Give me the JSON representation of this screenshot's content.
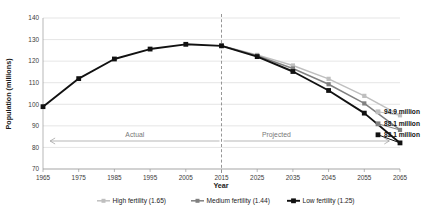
{
  "chart_data": {
    "type": "line",
    "title": "",
    "xlabel": "Year",
    "ylabel": "Population (millions)",
    "xlim": [
      1965,
      2065
    ],
    "ylim": [
      70,
      140
    ],
    "ytick_step": 10,
    "xtick_step": 10,
    "grid": true,
    "legend_position": "bottom",
    "categories": [
      1965,
      1975,
      1985,
      1995,
      2005,
      2015,
      2025,
      2035,
      2045,
      2055,
      2065
    ],
    "xticks": [
      "1965",
      "1975",
      "1985",
      "1995",
      "2005",
      "2015",
      "2025",
      "2035",
      "2045",
      "2055",
      "2065"
    ],
    "yticks": [
      "70",
      "80",
      "90",
      "100",
      "110",
      "120",
      "130",
      "140"
    ],
    "series": [
      {
        "name": "High fertility (1.65)",
        "color": "#bfbfbf",
        "marker": "square",
        "x": [
          2015,
          2025,
          2035,
          2045,
          2055,
          2065
        ],
        "values": [
          127.1,
          122.9,
          118.0,
          111.8,
          103.9,
          94.9
        ],
        "end_label": "94.9 million"
      },
      {
        "name": "Medium fertility (1.44)",
        "color": "#808080",
        "marker": "square",
        "x": [
          2015,
          2025,
          2035,
          2045,
          2055,
          2065
        ],
        "values": [
          127.1,
          122.5,
          116.6,
          109.3,
          100.4,
          88.1
        ],
        "end_label": "88.1 million"
      },
      {
        "name": "Low fertility (1.25)",
        "color": "#111111",
        "marker": "square",
        "x": [
          1965,
          1975,
          1985,
          1995,
          2005,
          2015,
          2025,
          2035,
          2045,
          2055,
          2065
        ],
        "values": [
          98.9,
          111.9,
          121.0,
          125.6,
          127.8,
          127.1,
          122.1,
          115.2,
          106.4,
          95.9,
          82.1
        ],
        "end_label": "82.1 million"
      }
    ],
    "annotations": [
      {
        "text": "Actual",
        "at_year": 1990,
        "direction": "left"
      },
      {
        "text": "Projected",
        "at_year": 2040,
        "direction": "right"
      }
    ],
    "divider": {
      "at_year": 2015,
      "style": "dashed"
    }
  },
  "legend": {
    "items": [
      {
        "label": "High fertility (1.65)",
        "color": "#bfbfbf"
      },
      {
        "label": "Medium fertility (1.44)",
        "color": "#808080"
      },
      {
        "label": "Low fertility (1.25)",
        "color": "#111111"
      }
    ]
  },
  "labels": {
    "high_end": "94.9 million",
    "medium_end": "88.1 million",
    "low_end": "82.1 million",
    "actual": "Actual",
    "projected": "Projected",
    "x_axis_title": "Year",
    "y_axis_title": "Population (millions)"
  }
}
